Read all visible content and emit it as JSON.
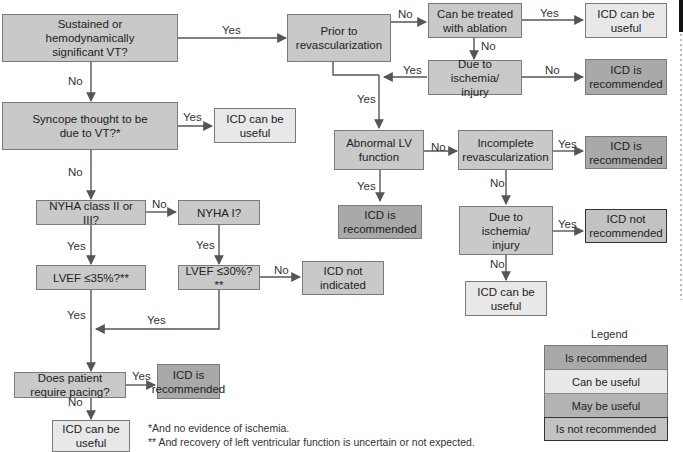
{
  "colors": {
    "question": "#c9c9c9",
    "is_recommended": "#a9a9a9",
    "can_be_useful": "#e8e8e8",
    "may_be_useful": "#b3b3b3",
    "is_not_recommended": "#c2c2c2",
    "line": "#555555"
  },
  "nodes": {
    "sustained_vt": "Sustained or\nhemodynamically\nsignificant VT?",
    "syncope": "Syncope thought to be\ndue to VT?*",
    "syncope_useful": "ICD can be\nuseful",
    "nyha_2_3": "NYHA class II or III?",
    "nyha_1": "NYHA I?",
    "lvef_35": "LVEF ≤35%?**",
    "lvef_30": "LVEF ≤30%?**",
    "not_indicated": "ICD not\nindicated",
    "pacing": "Does patient require pacing?",
    "pacing_rec": "ICD is\nrecommended",
    "pacing_useful": "ICD can be\nuseful",
    "prior_revasc": "Prior to\nrevascularization",
    "ablation": "Can be treated\nwith ablation",
    "ablation_useful": "ICD can be\nuseful",
    "ischemia1": "Due to ischemia/\ninjury",
    "ischemia1_rec": "ICD is\nrecommended",
    "abnormal_lv": "Abnormal LV\nfunction",
    "abnormal_lv_rec": "ICD is\nrecommended",
    "incomplete_revasc": "Incomplete\nrevascularization",
    "incomplete_rec": "ICD is\nrecommended",
    "ischemia2": "Due to ischemia/\ninjury",
    "ischemia2_notrec": "ICD not\nrecommended",
    "ischemia2_useful": "ICD can be\nuseful"
  },
  "edge_labels": {
    "vt_yes": "Yes",
    "vt_no": "No",
    "syncope_yes": "Yes",
    "syncope_no": "No",
    "nyha23_no": "No",
    "nyha23_yes": "Yes",
    "nyha1_yes": "Yes",
    "lvef30_no": "No",
    "lvef35_yes": "Yes",
    "lvef30_yes": "Yes",
    "pacing_yes": "Yes",
    "pacing_no": "No",
    "prior_no": "No",
    "ablation_yes": "Yes",
    "ablation_no": "No",
    "isch1_yes": "Yes",
    "isch1_no": "No",
    "merge_yes": "Yes",
    "lv_no": "No",
    "lv_yes": "Yes",
    "incomplete_yes": "Yes",
    "incomplete_no": "No",
    "isch2_yes": "Yes",
    "isch2_no": "No"
  },
  "footnotes": [
    "*And no evidence of ischemia.",
    "** And recovery of left ventricular function is uncertain or not expected."
  ],
  "legend": {
    "title": "Legend",
    "items": [
      "Is recommended",
      "Can be useful",
      "May be useful",
      "Is not recommended"
    ]
  }
}
